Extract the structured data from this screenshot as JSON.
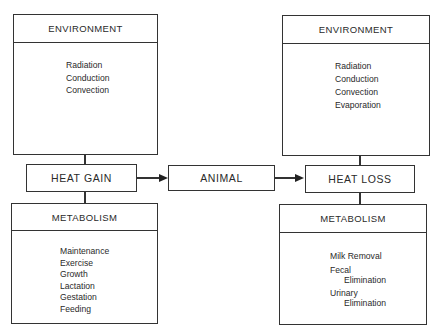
{
  "diagram": {
    "left": {
      "environment": {
        "title": "ENVIRONMENT",
        "items": [
          "Radiation",
          "Conduction",
          "Convection"
        ]
      },
      "node": {
        "label": "HEAT GAIN"
      },
      "metabolism": {
        "title": "METABOLISM",
        "items": [
          "Maintenance",
          "Exercise",
          "Growth",
          "Lactation",
          "Gestation",
          "Feeding"
        ]
      }
    },
    "center": {
      "node": {
        "label": "ANIMAL"
      }
    },
    "right": {
      "environment": {
        "title": "ENVIRONMENT",
        "items": [
          "Radiation",
          "Conduction",
          "Convection",
          "Evaporation"
        ]
      },
      "node": {
        "label": "HEAT LOSS"
      },
      "metabolism": {
        "title": "METABOLISM",
        "items": [
          {
            "line1": "Milk  Removal"
          },
          {
            "line1": "Fecal",
            "line2": "Elimination"
          },
          {
            "line1": "Urinary",
            "line2": "Elimination"
          }
        ]
      }
    },
    "edges": [
      {
        "from": "HEAT GAIN",
        "to": "ANIMAL"
      },
      {
        "from": "ANIMAL",
        "to": "HEAT LOSS"
      }
    ]
  }
}
